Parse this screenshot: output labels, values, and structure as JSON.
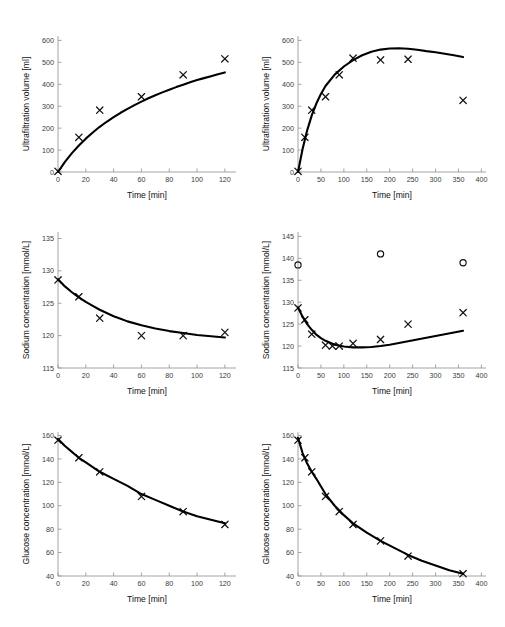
{
  "figure": {
    "layout": "3 rows x 2 columns of scatter plots with fitted curves",
    "background": "#ffffff",
    "curve_color": "#000000",
    "marker_color": "#111111",
    "axis_color": "#9a9a9a"
  },
  "chart_data": [
    {
      "id": "panel-uf-short",
      "position": "top-left",
      "type": "scatter",
      "title": "",
      "xlabel": "Time [min]",
      "ylabel": "Ultrafiltration volume [ml]",
      "xlim": [
        0,
        128
      ],
      "ylim": [
        0,
        620
      ],
      "xticks": [
        0,
        20,
        40,
        60,
        80,
        100,
        120
      ],
      "yticks": [
        0,
        100,
        200,
        300,
        400,
        500,
        600
      ],
      "grid": false,
      "legend": "none",
      "series": [
        {
          "name": "measured",
          "marker": "x",
          "x": [
            0,
            15,
            30,
            60,
            90,
            120
          ],
          "y": [
            3,
            158,
            282,
            343,
            443,
            516
          ]
        },
        {
          "name": "fitted curve",
          "marker": "line",
          "x": [
            0,
            5,
            10,
            15,
            20,
            25,
            30,
            35,
            40,
            45,
            50,
            55,
            60,
            65,
            70,
            75,
            80,
            85,
            90,
            95,
            100,
            105,
            110,
            115,
            120
          ],
          "y": [
            0,
            46,
            86,
            121,
            152,
            180,
            206,
            229,
            250,
            270,
            288,
            305,
            321,
            336,
            350,
            363,
            375,
            387,
            398,
            409,
            419,
            428,
            437,
            446,
            454
          ]
        }
      ]
    },
    {
      "id": "panel-uf-long",
      "position": "top-right",
      "type": "scatter",
      "title": "",
      "xlabel": "Time [min]",
      "ylabel": "Ultrafiltration volume [ml]",
      "xlim": [
        0,
        410
      ],
      "ylim": [
        0,
        620
      ],
      "xticks": [
        0,
        50,
        100,
        150,
        200,
        250,
        300,
        350,
        400
      ],
      "yticks": [
        0,
        100,
        200,
        300,
        400,
        500,
        600
      ],
      "grid": false,
      "legend": "none",
      "series": [
        {
          "name": "measured",
          "marker": "x",
          "x": [
            0,
            15,
            30,
            60,
            90,
            120,
            180,
            240,
            360
          ],
          "y": [
            3,
            158,
            282,
            343,
            443,
            519,
            511,
            514,
            327
          ]
        },
        {
          "name": "fitted curve",
          "marker": "line",
          "x": [
            0,
            10,
            20,
            30,
            40,
            50,
            60,
            80,
            100,
            120,
            140,
            160,
            180,
            200,
            220,
            240,
            260,
            280,
            300,
            320,
            340,
            360
          ],
          "y": [
            0,
            105,
            190,
            258,
            312,
            356,
            392,
            444,
            481,
            510,
            532,
            548,
            558,
            563,
            564,
            562,
            557,
            551,
            546,
            539,
            532,
            524
          ]
        }
      ]
    },
    {
      "id": "panel-sodium-short",
      "position": "middle-left",
      "type": "scatter",
      "title": "",
      "xlabel": "Time [min]",
      "ylabel": "Sodium concentration [mmol/L]",
      "xlim": [
        0,
        128
      ],
      "ylim": [
        115,
        136
      ],
      "xticks": [
        0,
        20,
        40,
        60,
        80,
        100,
        120
      ],
      "yticks": [
        115,
        120,
        125,
        130,
        135
      ],
      "grid": false,
      "legend": "none",
      "series": [
        {
          "name": "measured",
          "marker": "x",
          "x": [
            0,
            15,
            30,
            60,
            90,
            120
          ],
          "y": [
            128.6,
            126.0,
            122.7,
            120.0,
            120.0,
            120.5
          ]
        },
        {
          "name": "fitted curve",
          "marker": "line",
          "x": [
            0,
            5,
            10,
            15,
            20,
            25,
            30,
            35,
            40,
            45,
            50,
            60,
            70,
            80,
            90,
            100,
            110,
            120
          ],
          "y": [
            128.7,
            127.6,
            126.7,
            125.9,
            125.2,
            124.6,
            124.0,
            123.5,
            123.0,
            122.6,
            122.2,
            121.6,
            121.1,
            120.7,
            120.4,
            120.1,
            119.9,
            119.7
          ]
        }
      ]
    },
    {
      "id": "panel-sodium-long",
      "position": "middle-right",
      "type": "scatter",
      "title": "",
      "xlabel": "Time [min]",
      "ylabel": "Sodium concentration [mmol/L]",
      "xlim": [
        0,
        410
      ],
      "ylim": [
        115,
        146
      ],
      "xticks": [
        0,
        50,
        100,
        150,
        200,
        250,
        300,
        350,
        400
      ],
      "yticks": [
        115,
        120,
        125,
        130,
        135,
        140,
        145
      ],
      "grid": false,
      "legend": "none",
      "series": [
        {
          "name": "measured (x)",
          "marker": "x",
          "x": [
            0,
            15,
            30,
            60,
            75,
            90,
            120,
            180,
            240,
            360
          ],
          "y": [
            128.7,
            126.0,
            122.7,
            120.2,
            120.0,
            120.0,
            120.6,
            121.5,
            125.0,
            127.6
          ]
        },
        {
          "name": "measured (o)",
          "marker": "o",
          "x": [
            0,
            180,
            360
          ],
          "y": [
            138.5,
            141.0,
            139.0
          ]
        },
        {
          "name": "fitted curve",
          "marker": "line",
          "x": [
            0,
            10,
            20,
            30,
            40,
            50,
            60,
            80,
            100,
            120,
            140,
            160,
            180,
            200,
            220,
            240,
            260,
            280,
            300,
            320,
            340,
            360
          ],
          "y": [
            128.8,
            126.7,
            125.0,
            123.7,
            122.6,
            121.8,
            121.2,
            120.3,
            119.9,
            119.7,
            119.7,
            119.8,
            120.0,
            120.3,
            120.7,
            121.1,
            121.5,
            121.9,
            122.3,
            122.7,
            123.1,
            123.5
          ]
        }
      ]
    },
    {
      "id": "panel-glucose-short",
      "position": "bottom-left",
      "type": "scatter",
      "title": "",
      "xlabel": "Time [min]",
      "ylabel": "Glucose concentration [mmol/L]",
      "xlim": [
        0,
        128
      ],
      "ylim": [
        40,
        163
      ],
      "xticks": [
        0,
        20,
        40,
        60,
        80,
        100,
        120
      ],
      "yticks": [
        40,
        60,
        80,
        100,
        120,
        140,
        160
      ],
      "grid": false,
      "legend": "none",
      "series": [
        {
          "name": "measured",
          "marker": "x",
          "x": [
            0,
            15,
            30,
            60,
            90,
            120
          ],
          "y": [
            156,
            141,
            129,
            108,
            95,
            84
          ]
        },
        {
          "name": "fitted curve",
          "marker": "line",
          "x": [
            0,
            5,
            10,
            15,
            20,
            25,
            30,
            40,
            50,
            60,
            70,
            80,
            90,
            100,
            110,
            120
          ],
          "y": [
            157,
            151,
            146,
            141,
            137,
            133,
            129,
            123,
            117,
            110,
            105,
            100,
            95,
            91,
            88,
            85
          ]
        }
      ]
    },
    {
      "id": "panel-glucose-long",
      "position": "bottom-right",
      "type": "scatter",
      "title": "",
      "xlabel": "Time [min]",
      "ylabel": "Glucose concentration [mmol/L]",
      "xlim": [
        0,
        410
      ],
      "ylim": [
        40,
        163
      ],
      "xticks": [
        0,
        50,
        100,
        150,
        200,
        250,
        300,
        350,
        400
      ],
      "yticks": [
        40,
        60,
        80,
        100,
        120,
        140,
        160
      ],
      "grid": false,
      "legend": "none",
      "series": [
        {
          "name": "measured",
          "marker": "x",
          "x": [
            0,
            15,
            30,
            60,
            90,
            120,
            180,
            240,
            360
          ],
          "y": [
            156,
            141,
            129,
            108,
            95,
            84,
            70,
            57,
            42
          ]
        },
        {
          "name": "fitted curve",
          "marker": "line",
          "x": [
            0,
            10,
            20,
            30,
            40,
            60,
            80,
            100,
            120,
            150,
            180,
            210,
            240,
            270,
            300,
            330,
            360
          ],
          "y": [
            158,
            145,
            136,
            129,
            123,
            110,
            100,
            92,
            85,
            77,
            70,
            64,
            58,
            53,
            49,
            45,
            42
          ]
        }
      ]
    }
  ]
}
